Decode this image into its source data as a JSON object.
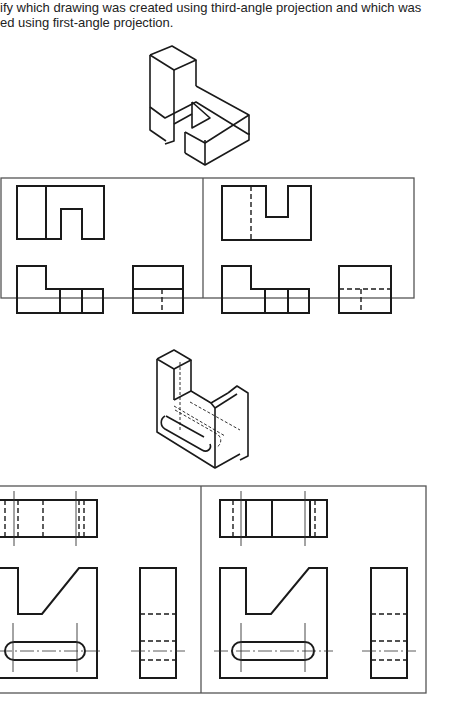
{
  "instructions": {
    "line1": "ify which drawing was created using third-angle projection and which was",
    "line2": "ed using first-angle projection."
  },
  "problems": [
    {
      "id": 1,
      "isometric": "L-shaped stepped block with square notch",
      "panels": [
        {
          "position": "left",
          "views": [
            "front",
            "top",
            "side"
          ],
          "layout": "top view above front view"
        },
        {
          "position": "right",
          "views": [
            "front",
            "top",
            "side"
          ],
          "layout": "hidden line in elevation"
        }
      ]
    },
    {
      "id": 2,
      "isometric": "block with angled cut and through slot",
      "panels": [
        {
          "position": "left",
          "views": [
            "top",
            "front",
            "side"
          ]
        },
        {
          "position": "right",
          "views": [
            "top",
            "front",
            "side"
          ]
        }
      ]
    }
  ],
  "colors": {
    "line": "#1a1a1a",
    "frame": "#555555",
    "background": "#ffffff"
  }
}
